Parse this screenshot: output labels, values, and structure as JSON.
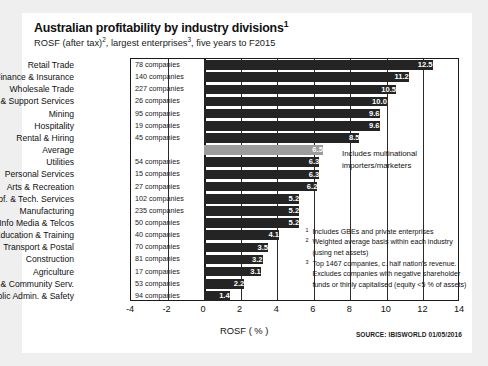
{
  "header": {
    "title_main": "Australian profitability by industry divisions",
    "title_sup": "1",
    "subtitle_a": "ROSF (after tax)",
    "subtitle_sup1": "2",
    "subtitle_b": ", largest enterprises",
    "subtitle_sup2": "3",
    "subtitle_c": ", five years to F2015"
  },
  "annotation": {
    "line1": "Includes multinational",
    "line2": "importers/marketers"
  },
  "footnotes": [
    {
      "mark": "1",
      "text": "Includes GBEs and private enterprises"
    },
    {
      "mark": "2",
      "text": "Weighted average basis within each  industry"
    },
    {
      "mark": "",
      "text": "(using net assets)"
    },
    {
      "mark": "3",
      "text": "Top 1467 companies, c. half nation's revenue."
    },
    {
      "mark": "",
      "text": "Excludes companies with negative shareholder"
    },
    {
      "mark": "",
      "text": "funds or thinly capitalised (equity <5 % of assets)"
    }
  ],
  "source": "SOURCE: IBISWORLD 01/05/2016",
  "chart_data": {
    "type": "bar",
    "orientation": "horizontal",
    "title": "Australian profitability by industry divisions",
    "subtitle": "ROSF (after tax), largest enterprises, five years to F2015",
    "xlabel": "ROSF ( % )",
    "ylabel": "",
    "xlim": [
      -4,
      14
    ],
    "xticks": [
      -4,
      -2,
      0,
      2,
      4,
      6,
      8,
      10,
      12,
      14
    ],
    "grid": true,
    "legend": null,
    "categories": [
      "Retail Trade",
      "Finance & Insurance",
      "Wholesale Trade",
      "Admin. & Support Services",
      "Mining",
      "Hospitality",
      "Rental & Hiring",
      "Average",
      "Utilities",
      "Personal Services",
      "Arts & Recreation",
      "Prof. & Tech. Services",
      "Manufacturing",
      "Info Media & Telcos",
      "Education & Training",
      "Transport & Postal",
      "Construction",
      "Agriculture",
      "Health & Community Serv.",
      "Public Admin. & Safety"
    ],
    "values": [
      12.5,
      11.2,
      10.5,
      10.0,
      9.6,
      9.6,
      8.5,
      6.5,
      6.3,
      6.3,
      6.2,
      5.2,
      5.2,
      5.2,
      4.1,
      3.5,
      3.2,
      3.1,
      2.2,
      1.4
    ],
    "value_labels": [
      "12.5",
      "11.2",
      "10.5",
      "10.0",
      "9.6",
      "9.6",
      "8.5",
      "6.5",
      "6.3",
      "6.3",
      "6.2",
      "5.2",
      "5.2",
      "5.2",
      "4.1",
      "3.5",
      "3.2",
      "3.1",
      "2.2",
      "1.4"
    ],
    "companies": [
      "78 companies",
      "140 companies",
      "227 companies",
      "26 companies",
      "95 companies",
      "19 companies",
      "45 companies",
      "",
      "54 companies",
      "15 companies",
      "27 companies",
      "102 companies",
      "235 companies",
      "50 companies",
      "40 companies",
      "70 companies",
      "81 companies",
      "17 companies",
      "53 companies",
      "94 companies"
    ],
    "highlight_index": 7,
    "bar_color": "#242424",
    "highlight_color": "#9c9c9c"
  }
}
